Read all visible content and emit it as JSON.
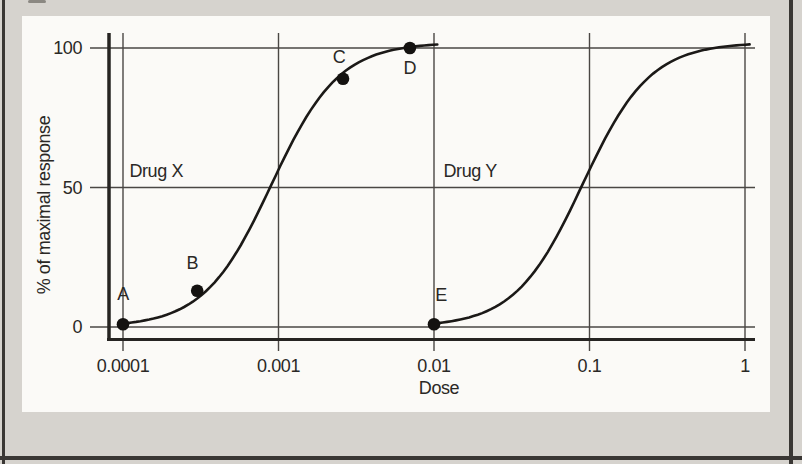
{
  "figure": {
    "colors": {
      "background": "#d6d3ce",
      "panel": "#fbfaf7",
      "grid": "#4a4744",
      "axis": "#262422",
      "curve": "#1b1917",
      "point": "#141210",
      "text": "#2a2825",
      "border": "#3a3734"
    }
  },
  "chart_data": {
    "type": "line",
    "title": "",
    "xlabel": "Dose",
    "ylabel": "% of maximal response",
    "x_scale": "log10",
    "xlim": [
      0.0001,
      1
    ],
    "ylim": [
      0,
      100
    ],
    "grid": true,
    "x_ticks": [
      {
        "value": 0.0001,
        "label": "0.0001"
      },
      {
        "value": 0.001,
        "label": "0.001"
      },
      {
        "value": 0.01,
        "label": "0.01"
      },
      {
        "value": 0.1,
        "label": "0.1"
      },
      {
        "value": 1,
        "label": "1"
      }
    ],
    "y_ticks": [
      {
        "value": 0,
        "label": "0"
      },
      {
        "value": 50,
        "label": "50"
      },
      {
        "value": 100,
        "label": "100"
      }
    ],
    "series": [
      {
        "name": "Drug X",
        "shape": "sigmoid",
        "ec50": 0.0009,
        "hill": 2,
        "ymax": 102,
        "x_start": 0.0001,
        "x_end": 0.0105
      },
      {
        "name": "Drug Y",
        "shape": "sigmoid",
        "ec50": 0.09,
        "hill": 2,
        "ymax": 102,
        "x_start": 0.01,
        "x_end": 1.07
      }
    ],
    "series_labels": [
      {
        "text": "Drug X",
        "x": 0.00011,
        "y": 56
      },
      {
        "text": "Drug Y",
        "x": 0.0115,
        "y": 56
      }
    ],
    "points": [
      {
        "label": "A",
        "series": "Drug X",
        "x": 0.0001,
        "y": 1
      },
      {
        "label": "B",
        "series": "Drug X",
        "x": 0.0003,
        "y": 13
      },
      {
        "label": "C",
        "series": "Drug X",
        "x": 0.0026,
        "y": 89
      },
      {
        "label": "D",
        "series": "Drug X",
        "x": 0.007,
        "y": 100
      },
      {
        "label": "E",
        "series": "Drug Y",
        "x": 0.01,
        "y": 1
      }
    ]
  }
}
